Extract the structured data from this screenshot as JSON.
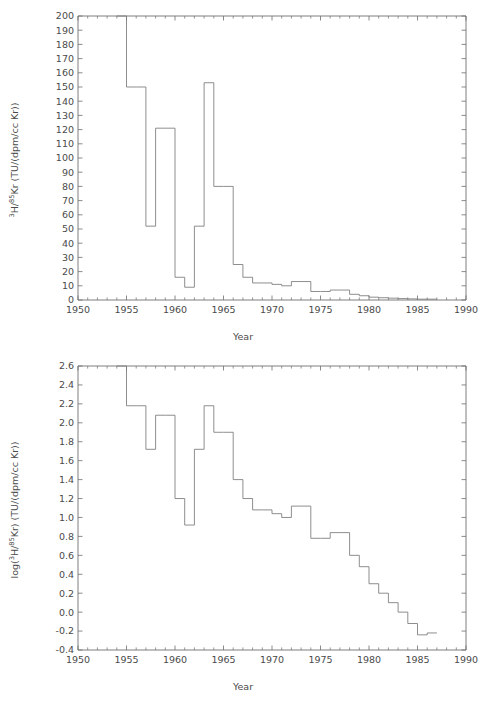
{
  "figure": {
    "background": "#ffffff",
    "line_color": "#7a7a7a",
    "axis_color": "#6f6f6f",
    "text_color": "#4a4a4a"
  },
  "chart_data": [
    {
      "type": "line",
      "plot_style": "step-post",
      "panel": "top",
      "title": "",
      "xlabel": "Year",
      "ylabel": "3H/85Kr (TU/(dpm/cc Kr))",
      "ylabel_parts": {
        "pre": "",
        "sup1": "3",
        "mid1": "H/",
        "sup2": "85",
        "mid2": "Kr (TU/(dpm/cc Kr))"
      },
      "xlim": [
        1950,
        1990
      ],
      "ylim": [
        0,
        200
      ],
      "xticks": [
        1950,
        1955,
        1960,
        1965,
        1970,
        1975,
        1980,
        1985,
        1990
      ],
      "xtick_labels": [
        "1950",
        "1955",
        "1960",
        "1965",
        "1970",
        "1975",
        "1980",
        "1985",
        "1990"
      ],
      "xtick_minor_step": 1,
      "yticks": [
        0,
        10,
        20,
        30,
        40,
        50,
        60,
        70,
        80,
        90,
        100,
        110,
        120,
        130,
        140,
        150,
        160,
        170,
        180,
        190,
        200
      ],
      "ytick_labels": [
        "0",
        "10",
        "20",
        "30",
        "40",
        "50",
        "60",
        "70",
        "80",
        "90",
        "100",
        "110",
        "120",
        "130",
        "140",
        "150",
        "160",
        "170",
        "180",
        "190",
        "200"
      ],
      "grid": false,
      "legend": "none",
      "x": [
        1954,
        1955,
        1956,
        1957,
        1958,
        1959,
        1960,
        1961,
        1962,
        1963,
        1964,
        1965,
        1966,
        1967,
        1968,
        1969,
        1970,
        1971,
        1972,
        1973,
        1974,
        1975,
        1976,
        1977,
        1978,
        1979,
        1980,
        1981,
        1982,
        1983,
        1984,
        1985,
        1986
      ],
      "values": [
        260,
        150,
        150,
        52,
        121,
        121,
        16,
        9,
        52,
        153,
        80,
        80,
        25,
        16,
        12,
        12,
        11,
        10,
        13,
        13,
        6,
        6,
        7,
        7,
        4,
        3,
        2,
        1.6,
        1.3,
        1.0,
        0.8,
        0.6,
        0.6
      ],
      "y_units": "TU/(dpm/cc Kr)",
      "notes": "Step plot of tritium to krypton-85 ratio; initial 1954 value exceeds axis top of 200 and is clipped."
    },
    {
      "type": "line",
      "plot_style": "step-post",
      "panel": "bottom",
      "title": "",
      "xlabel": "Year",
      "ylabel": "log(3H/85Kr) (TU/(dpm/cc Kr))",
      "ylabel_parts": {
        "pre": "log(",
        "sup1": "3",
        "mid1": "H/",
        "sup2": "85",
        "mid2": "Kr) (TU/(dpm/cc Kr))"
      },
      "xlim": [
        1950,
        1990
      ],
      "ylim": [
        -0.4,
        2.6
      ],
      "xticks": [
        1950,
        1955,
        1960,
        1965,
        1970,
        1975,
        1980,
        1985,
        1990
      ],
      "xtick_labels": [
        "1950",
        "1955",
        "1960",
        "1965",
        "1970",
        "1975",
        "1980",
        "1985",
        "1990"
      ],
      "xtick_minor_step": 1,
      "yticks": [
        -0.4,
        -0.2,
        0.0,
        0.2,
        0.4,
        0.6,
        0.8,
        1.0,
        1.2,
        1.4,
        1.6,
        1.8,
        2.0,
        2.2,
        2.4,
        2.6
      ],
      "ytick_labels": [
        "-0.4",
        "-0.2",
        "0.0",
        "0.2",
        "0.4",
        "0.6",
        "0.8",
        "1.0",
        "1.2",
        "1.4",
        "1.6",
        "1.8",
        "2.0",
        "2.2",
        "2.4",
        "2.6"
      ],
      "grid": false,
      "legend": "none",
      "x": [
        1954,
        1955,
        1956,
        1957,
        1958,
        1959,
        1960,
        1961,
        1962,
        1963,
        1964,
        1965,
        1966,
        1967,
        1968,
        1969,
        1970,
        1971,
        1972,
        1973,
        1974,
        1975,
        1976,
        1977,
        1978,
        1979,
        1980,
        1981,
        1982,
        1983,
        1984,
        1985,
        1986
      ],
      "values": [
        2.8,
        2.18,
        2.18,
        1.72,
        2.08,
        2.08,
        1.2,
        0.92,
        1.72,
        2.18,
        1.9,
        1.9,
        1.4,
        1.2,
        1.08,
        1.08,
        1.04,
        1.0,
        1.12,
        1.12,
        0.78,
        0.78,
        0.84,
        0.84,
        0.6,
        0.48,
        0.3,
        0.2,
        0.1,
        0.0,
        -0.12,
        -0.24,
        -0.22
      ],
      "y_units": "log10 TU/(dpm/cc Kr)",
      "notes": "Base-10 logarithm of the upper panel ratio; 1954 value above axis top of 2.6 and clipped."
    }
  ]
}
